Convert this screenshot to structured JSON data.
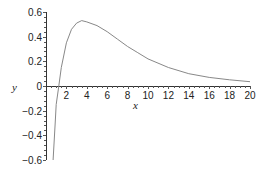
{
  "chart_data": {
    "type": "line",
    "title": "",
    "xlabel": "x",
    "ylabel": "y",
    "xlim": [
      0,
      20
    ],
    "ylim": [
      -0.6,
      0.6
    ],
    "grid": false,
    "legend": null,
    "x_ticks": [
      "2",
      "4",
      "6",
      "8",
      "10",
      "12",
      "14",
      "16",
      "18",
      "20"
    ],
    "y_ticks": [
      "0.6",
      "0.4",
      "0.2",
      "0",
      "-0.2",
      "-0.4",
      "-0.6"
    ],
    "series": [
      {
        "name": "curve",
        "color": "#888888",
        "x": [
          0.7,
          0.9,
          1.0,
          1.25,
          1.5,
          2.0,
          2.5,
          3.0,
          3.5,
          4.0,
          5.0,
          6.0,
          7.0,
          8.0,
          9.0,
          10.0,
          12.0,
          14.0,
          16.0,
          18.0,
          20.0
        ],
        "y": [
          -0.6,
          -0.3,
          -0.15,
          0.0,
          0.15,
          0.35,
          0.46,
          0.51,
          0.53,
          0.52,
          0.49,
          0.44,
          0.38,
          0.32,
          0.27,
          0.22,
          0.15,
          0.1,
          0.07,
          0.05,
          0.035
        ]
      }
    ]
  }
}
